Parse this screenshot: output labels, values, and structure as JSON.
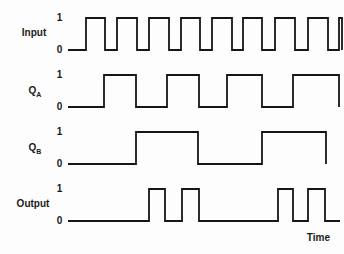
{
  "figure": {
    "background": "#fdfdfd",
    "line_color": "#161616",
    "text_color": "#1a1a1a",
    "time_label": "Time",
    "tick_high": "1",
    "tick_low": "0",
    "tick_x": 59.5,
    "x_start": 68,
    "waveforms": [
      {
        "id": "input",
        "label": "Input",
        "subscript": "",
        "label_x": 34,
        "label_y": 33,
        "y_high": 18,
        "y_low": 50,
        "initial_level": 0,
        "transitions": [
          86,
          105,
          117,
          137,
          149,
          169,
          181,
          200,
          212,
          232,
          243,
          262,
          275,
          295,
          308,
          328,
          339,
          342
        ],
        "x_end": 342
      },
      {
        "id": "qa",
        "label": "Q",
        "subscript": "A",
        "label_x": 35,
        "label_y": 92,
        "y_high": 75,
        "y_low": 107,
        "initial_level": 0,
        "transitions": [
          104,
          136,
          167,
          199,
          227,
          262,
          293,
          339
        ],
        "x_end": 339
      },
      {
        "id": "qb",
        "label": "Q",
        "subscript": "B",
        "label_x": 35,
        "label_y": 149,
        "y_high": 132,
        "y_low": 164,
        "initial_level": 0,
        "transitions": [
          136,
          198,
          262,
          326
        ],
        "x_end": 326
      },
      {
        "id": "output",
        "label": "Output",
        "subscript": "",
        "label_x": 33,
        "label_y": 204,
        "y_high": 189,
        "y_low": 221,
        "initial_level": 0,
        "transitions": [
          149,
          165,
          182,
          199,
          278,
          293,
          308,
          325
        ],
        "x_end": 340
      }
    ],
    "semantics": "Two-bit ripple counter timing diagram: QA toggles on Input falling edges (divide-by-2), QB toggles on QA falling edges (divide-by-4), Output pulses occur where Input and QB are both high."
  }
}
